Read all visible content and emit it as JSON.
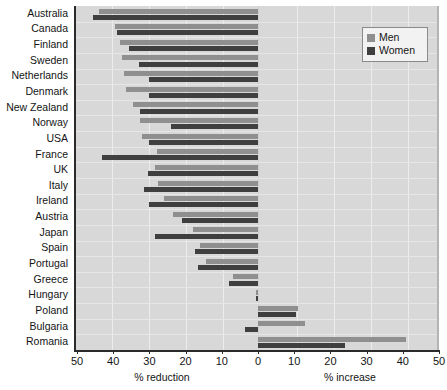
{
  "chart_data": {
    "type": "bar",
    "orientation": "horizontal",
    "title": "",
    "subtitle": "",
    "xlabel_left": "% reduction",
    "xlabel_right": "% increase",
    "ylabel": "",
    "grid": true,
    "legend_position": "top-right",
    "axis": {
      "ticks": [
        {
          "label": "50",
          "value": -50
        },
        {
          "label": "40",
          "value": -40
        },
        {
          "label": "30",
          "value": -30
        },
        {
          "label": "20",
          "value": -20
        },
        {
          "label": "10",
          "value": -10
        },
        {
          "label": "0",
          "value": 0
        },
        {
          "label": "10",
          "value": 10
        },
        {
          "label": "20",
          "value": 20
        },
        {
          "label": "30",
          "value": 30
        },
        {
          "label": "40",
          "value": 40
        },
        {
          "label": "50",
          "value": 50
        }
      ],
      "xlim": [
        -50,
        50
      ]
    },
    "legend": [
      {
        "name": "Men",
        "color": "#8f8f8f"
      },
      {
        "name": "Women",
        "color": "#3f3f3f"
      }
    ],
    "categories": [
      "Australia",
      "Canada",
      "Finland",
      "Sweden",
      "Netherlands",
      "Denmark",
      "New Zealand",
      "Norway",
      "USA",
      "France",
      "UK",
      "Italy",
      "Ireland",
      "Austria",
      "Japan",
      "Spain",
      "Portugal",
      "Greece",
      "Hungary",
      "Poland",
      "Bulgaria",
      "Romania"
    ],
    "series": [
      {
        "name": "Men",
        "color": "#8f8f8f",
        "values": [
          -43.8,
          -39.5,
          -38.0,
          -37.5,
          -37.0,
          -36.5,
          -34.5,
          -32.5,
          -32.0,
          -28.0,
          -28.5,
          -27.5,
          -26.0,
          -23.5,
          -18.0,
          -16.0,
          -14.5,
          -7.0,
          -0.5,
          11.0,
          13.0,
          41.0
        ]
      },
      {
        "name": "Women",
        "color": "#3f3f3f",
        "values": [
          -45.7,
          -39.0,
          -35.5,
          -33.0,
          -30.0,
          -30.0,
          -32.5,
          -24.0,
          -30.0,
          -43.0,
          -30.5,
          -31.5,
          -30.0,
          -21.0,
          -28.5,
          -17.5,
          -16.5,
          -8.0,
          -0.5,
          10.5,
          -3.5,
          24.0
        ]
      }
    ]
  }
}
